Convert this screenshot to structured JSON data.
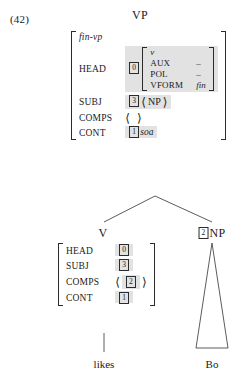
{
  "example": {
    "number": "(42)"
  },
  "tree": {
    "root": {
      "label": "VP"
    },
    "daughters": [
      {
        "label": "V",
        "tag": ""
      },
      {
        "label": "NP",
        "tag": "2"
      }
    ],
    "terminals": [
      {
        "text": "likes"
      },
      {
        "text": "Bo"
      }
    ]
  },
  "vp_avm": {
    "type": "fin-vp",
    "features": [
      {
        "attr": "HEAD",
        "tag": "0"
      },
      {
        "attr": "SUBJ",
        "tag": "3",
        "list": "NP"
      },
      {
        "attr": "COMPS",
        "list_empty": true
      },
      {
        "attr": "CONT",
        "tag": "1",
        "value": "soa"
      }
    ],
    "head_inner": {
      "type": "v",
      "features": [
        {
          "attr": "AUX",
          "value": "–"
        },
        {
          "attr": "POL",
          "value": "–"
        },
        {
          "attr": "VFORM",
          "value": "fin"
        }
      ]
    }
  },
  "v_avm": {
    "features": [
      {
        "attr": "HEAD",
        "tag": "0"
      },
      {
        "attr": "SUBJ",
        "tag": "3"
      },
      {
        "attr": "COMPS",
        "tag": "2",
        "bracketed": true
      },
      {
        "attr": "CONT",
        "tag": "1"
      }
    ]
  },
  "brackets": {
    "open_angle": "⟨",
    "close_angle": "⟩"
  },
  "colors": {
    "ink": "#1a1a1a",
    "rule": "#4a4a4a",
    "shade": "#e2e2e2",
    "background": "#ffffff"
  }
}
